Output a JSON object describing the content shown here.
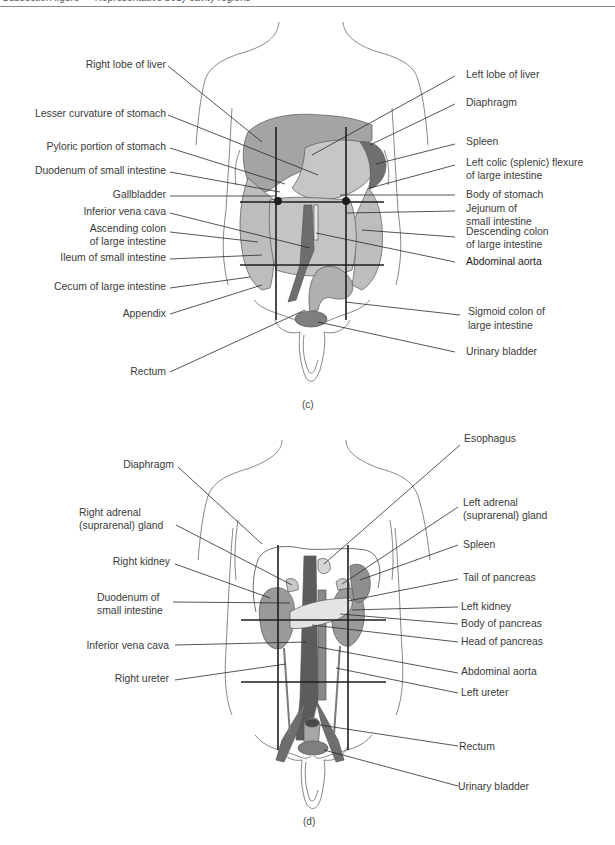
{
  "header": {
    "running_text": "Subsection figure — Representative body cavity regions"
  },
  "figure_c": {
    "caption": "(c)",
    "labels_left": [
      {
        "text": "Right lobe of liver"
      },
      {
        "text": "Lesser curvature of stomach"
      },
      {
        "text": "Pyloric portion of stomach"
      },
      {
        "text": "Duodenum of small intestine"
      },
      {
        "text": "Gallbladder"
      },
      {
        "text": "Inferior vena cava"
      },
      {
        "line1": "Ascending colon",
        "line2": "of large intestine"
      },
      {
        "text": "Ileum of small intestine"
      },
      {
        "text": "Cecum of large intestine"
      },
      {
        "text": "Appendix"
      },
      {
        "text": "Rectum"
      }
    ],
    "labels_right": [
      {
        "text": "Left lobe of liver"
      },
      {
        "text": "Diaphragm"
      },
      {
        "text": "Spleen"
      },
      {
        "line1": "Left colic (splenic) flexure",
        "line2": "of large intestine"
      },
      {
        "text": "Body of stomach"
      },
      {
        "line1": "Jejunum of",
        "line2": "small intestine"
      },
      {
        "line1": "Descending colon",
        "line2": "of large intestine"
      },
      {
        "text": "Abdominal aorta"
      },
      {
        "line1": "Sigmoid colon of",
        "line2": "large intestine"
      },
      {
        "text": "Urinary bladder"
      }
    ]
  },
  "figure_d": {
    "caption": "(d)",
    "labels_left": [
      {
        "text": "Diaphragm"
      },
      {
        "line1": "Right adrenal",
        "line2": "(suprarenal) gland"
      },
      {
        "text": "Right kidney"
      },
      {
        "line1": "Duodenum of",
        "line2": "small intestine"
      },
      {
        "text": "Inferior vena cava"
      },
      {
        "text": "Right ureter"
      }
    ],
    "labels_right": [
      {
        "text": "Esophagus"
      },
      {
        "line1": "Left adrenal",
        "line2": "(suprarenal) gland"
      },
      {
        "text": "Spleen"
      },
      {
        "text": "Tail of pancreas"
      },
      {
        "text": "Left kidney"
      },
      {
        "text": "Body of pancreas"
      },
      {
        "text": "Head of pancreas"
      },
      {
        "text": "Abdominal aorta"
      },
      {
        "text": "Left ureter"
      },
      {
        "text": "Rectum"
      },
      {
        "text": "Urinary bladder"
      }
    ]
  },
  "colors": {
    "organ_light": "#c8c8c8",
    "organ_mid": "#a9a9a9",
    "organ_dark": "#7a7a7a",
    "outline": "#5a5a5a",
    "leader": "#2a2a2a",
    "text": "#3a3a3a"
  }
}
